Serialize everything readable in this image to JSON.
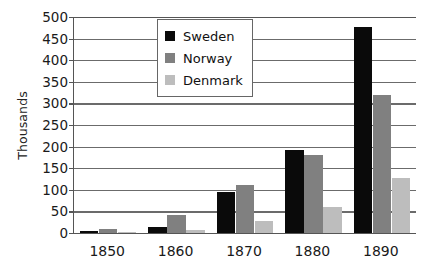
{
  "chart_data": {
    "type": "bar",
    "title": "",
    "subtitle": "",
    "xlabel": "",
    "ylabel": "Thousands",
    "categories": [
      "1850",
      "1860",
      "1870",
      "1880",
      "1890"
    ],
    "series": [
      {
        "name": "Sweden",
        "color": "#0a0a0a",
        "values": [
          4,
          15,
          95,
          193,
          478
        ]
      },
      {
        "name": "Norway",
        "color": "#808080",
        "values": [
          10,
          42,
          110,
          180,
          320
        ]
      },
      {
        "name": "Denmark",
        "color": "#bdbdbd",
        "values": [
          1,
          6,
          28,
          61,
          128
        ]
      }
    ],
    "ylim": [
      0,
      500
    ],
    "ytick_values": [
      0,
      50,
      100,
      150,
      200,
      250,
      300,
      350,
      400,
      450,
      500
    ],
    "ytick_labels": [
      "0",
      "50",
      "100",
      "150",
      "200",
      "250",
      "300",
      "350",
      "400",
      "450",
      "500"
    ],
    "grid": true,
    "grid_axis": "y",
    "legend_position": "top-center",
    "legend_entries": [
      "Sweden",
      "Norway",
      "Denmark"
    ]
  }
}
